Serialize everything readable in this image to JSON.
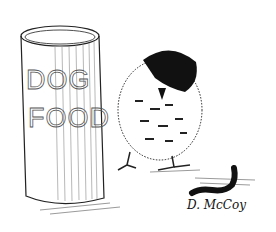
{
  "illustration": {
    "subject": "Bird standing beside a dog food canister, looking at a worm",
    "canister_label_line1": "DOG",
    "canister_label_line2": "FOOD",
    "signature": "D. McCoy",
    "colors": {
      "ink": "#111111",
      "paper": "#ffffff"
    }
  }
}
